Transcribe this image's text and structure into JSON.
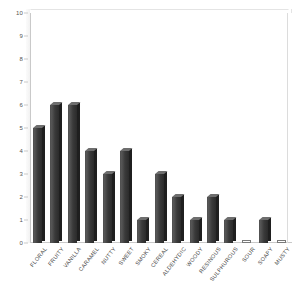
{
  "chart_data": {
    "type": "bar",
    "title": "",
    "subtitle": "",
    "xlabel": "",
    "ylabel": "",
    "ylim": [
      0,
      10
    ],
    "ytick_step": 1,
    "yticks": [
      "10",
      "9",
      "8",
      "7",
      "6",
      "5",
      "4",
      "3",
      "2",
      "1",
      "0"
    ],
    "grid": false,
    "legend": "none",
    "orientation": "vertical",
    "style": "3d-bar",
    "categories": [
      "FLORAL",
      "FRUITY",
      "VANILLA",
      "CARAMEL",
      "NUTTY",
      "SWEET",
      "SMOKY",
      "CEREAL",
      "ALDEHYDIC",
      "WOODY",
      "RESINOUS",
      "SULPHUROUS",
      "SOUR",
      "SOAPY",
      "MUSTY"
    ],
    "values": [
      5,
      6,
      6,
      4,
      3,
      4,
      1,
      3,
      2,
      1,
      2,
      1,
      0,
      1,
      0
    ],
    "colors": {
      "bar_face": "#3a3a3a",
      "bar_side": "#1f1f1f",
      "bar_top": "#6e6e6e",
      "axis": "#c9c9c9",
      "background": "#ffffff",
      "tick_text": "#555555",
      "label_text": "#4a4a4a"
    }
  }
}
